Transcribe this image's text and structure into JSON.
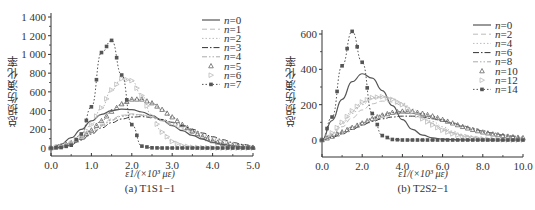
{
  "chart_data": [
    {
      "type": "line",
      "panel": "a",
      "caption": "(a) T1S1−1",
      "xlabel": "ε1/(×10³ με)",
      "ylabel": "总损伤演化率",
      "xlim": [
        0.0,
        5.0
      ],
      "ylim": [
        -50,
        1400
      ],
      "xticks": [
        "0.0",
        "1.0",
        "2.0",
        "3.0",
        "4.0",
        "5.0"
      ],
      "yticks": [
        "0",
        "200",
        "400",
        "600",
        "800",
        "1 000",
        "1 200",
        "1 400"
      ],
      "ytick_values": [
        0,
        200,
        400,
        600,
        800,
        1000,
        1200,
        1400
      ],
      "legend_position": "upper right",
      "grid": false,
      "x": [
        0.0,
        0.25,
        0.5,
        0.75,
        1.0,
        1.25,
        1.5,
        1.75,
        2.0,
        2.25,
        2.5,
        2.75,
        3.0,
        3.25,
        3.5,
        3.75,
        4.0,
        4.25,
        4.5,
        4.75,
        5.0
      ],
      "series": [
        {
          "name": "n=0",
          "style": "solid",
          "color": "#555555",
          "values": [
            0,
            40,
            110,
            200,
            290,
            360,
            400,
            415,
            410,
            385,
            345,
            295,
            240,
            185,
            135,
            95,
            60,
            38,
            22,
            12,
            6
          ]
        },
        {
          "name": "n=1",
          "style": "dash",
          "color": "#bbbbbb",
          "values": [
            0,
            20,
            55,
            110,
            180,
            250,
            310,
            350,
            365,
            355,
            330,
            290,
            245,
            200,
            155,
            115,
            80,
            55,
            35,
            20,
            12
          ]
        },
        {
          "name": "n=2",
          "style": "dot",
          "color": "#bbbbbb",
          "values": [
            0,
            15,
            45,
            95,
            160,
            230,
            295,
            340,
            360,
            355,
            330,
            295,
            255,
            210,
            170,
            130,
            95,
            68,
            45,
            28,
            18
          ]
        },
        {
          "name": "n=3",
          "style": "dashdot",
          "color": "#333333",
          "values": [
            0,
            15,
            40,
            85,
            150,
            215,
            270,
            310,
            330,
            335,
            325,
            305,
            275,
            240,
            200,
            160,
            120,
            88,
            60,
            38,
            22
          ]
        },
        {
          "name": "n=4",
          "style": "dashdotdot",
          "color": "#aaaaaa",
          "values": [
            0,
            15,
            45,
            95,
            165,
            240,
            300,
            340,
            355,
            350,
            330,
            300,
            265,
            225,
            185,
            145,
            110,
            80,
            55,
            35,
            20
          ]
        },
        {
          "name": "n=5",
          "style": "triangle-up",
          "color": "#666666",
          "values": [
            0,
            20,
            55,
            110,
            190,
            290,
            390,
            470,
            520,
            520,
            480,
            410,
            330,
            250,
            180,
            120,
            75,
            45,
            25,
            12,
            6
          ]
        },
        {
          "name": "n=6",
          "style": "triangle-right",
          "color": "#bbbbbb",
          "values": [
            0,
            15,
            50,
            120,
            250,
            430,
            620,
            740,
            720,
            560,
            340,
            170,
            70,
            25,
            8,
            3,
            1,
            0,
            0,
            0,
            0
          ]
        },
        {
          "name": "n=7",
          "style": "square-dotted",
          "color": "#555555",
          "values": [
            0,
            5,
            30,
            150,
            440,
            1020,
            1150,
            780,
            250,
            20,
            2,
            0,
            0,
            0,
            0,
            0,
            0,
            0,
            0,
            0,
            0
          ]
        }
      ]
    },
    {
      "type": "line",
      "panel": "b",
      "caption": "(b) T2S2−1",
      "xlabel": "ε1/(×10³ με)",
      "ylabel": "总损伤演化率",
      "xlim": [
        0.0,
        10.0
      ],
      "ylim": [
        -100,
        700
      ],
      "xticks": [
        "0.0",
        "2.0",
        "4.0",
        "6.0",
        "8.0",
        "10.0"
      ],
      "yticks": [
        "0",
        "200",
        "400",
        "600"
      ],
      "ytick_values": [
        0,
        200,
        400,
        600
      ],
      "legend_position": "upper right",
      "grid": false,
      "x": [
        0.0,
        0.5,
        1.0,
        1.5,
        2.0,
        2.5,
        3.0,
        3.5,
        4.0,
        4.5,
        5.0,
        5.5,
        6.0,
        6.5,
        7.0,
        7.5,
        8.0,
        8.5,
        9.0,
        9.5,
        10.0
      ],
      "series": [
        {
          "name": "n=0",
          "style": "solid",
          "color": "#555555",
          "values": [
            0,
            110,
            230,
            330,
            375,
            350,
            280,
            195,
            115,
            60,
            28,
            12,
            5,
            2,
            1,
            0,
            0,
            0,
            0,
            0,
            0
          ]
        },
        {
          "name": "n=2",
          "style": "dash",
          "color": "#bbbbbb",
          "values": [
            0,
            30,
            75,
            125,
            170,
            205,
            220,
            215,
            195,
            165,
            130,
            95,
            65,
            42,
            26,
            15,
            8,
            4,
            2,
            1,
            0
          ]
        },
        {
          "name": "n=4",
          "style": "dot",
          "color": "#bbbbbb",
          "values": [
            0,
            35,
            90,
            150,
            200,
            235,
            245,
            235,
            210,
            175,
            140,
            105,
            75,
            50,
            32,
            20,
            12,
            7,
            4,
            2,
            1
          ]
        },
        {
          "name": "n=6",
          "style": "dashdot",
          "color": "#333333",
          "values": [
            0,
            15,
            35,
            60,
            85,
            105,
            120,
            130,
            135,
            135,
            130,
            120,
            108,
            95,
            80,
            66,
            52,
            40,
            30,
            22,
            15
          ]
        },
        {
          "name": "n=8",
          "style": "dashdotdot",
          "color": "#aaaaaa",
          "values": [
            0,
            20,
            45,
            75,
            100,
            125,
            145,
            155,
            158,
            155,
            145,
            130,
            115,
            98,
            80,
            64,
            50,
            38,
            28,
            20,
            14
          ]
        },
        {
          "name": "n=10",
          "style": "triangle-up",
          "color": "#666666",
          "values": [
            0,
            20,
            45,
            70,
            95,
            120,
            140,
            155,
            162,
            160,
            150,
            135,
            115,
            95,
            75,
            58,
            44,
            33,
            24,
            17,
            12
          ]
        },
        {
          "name": "n=12",
          "style": "triangle-right",
          "color": "#bbbbbb",
          "values": [
            0,
            40,
            100,
            165,
            215,
            240,
            245,
            230,
            200,
            160,
            120,
            85,
            55,
            35,
            20,
            12,
            6,
            3,
            1,
            0,
            0
          ]
        },
        {
          "name": "n=14",
          "style": "square-dotted",
          "color": "#555555",
          "values": [
            0,
            130,
            420,
            615,
            440,
            150,
            25,
            3,
            0,
            0,
            0,
            0,
            0,
            0,
            0,
            0,
            0,
            0,
            0,
            0,
            0
          ]
        }
      ]
    }
  ],
  "panels": {
    "a": {
      "caption": "(a) T1S1−1",
      "xlabel": "ε1/(×10³ με)",
      "ylabel": "总损伤演化率"
    },
    "b": {
      "caption": "(b) T2S2−1",
      "xlabel": "ε1/(×10³ με)",
      "ylabel": "总损伤演化率"
    }
  }
}
